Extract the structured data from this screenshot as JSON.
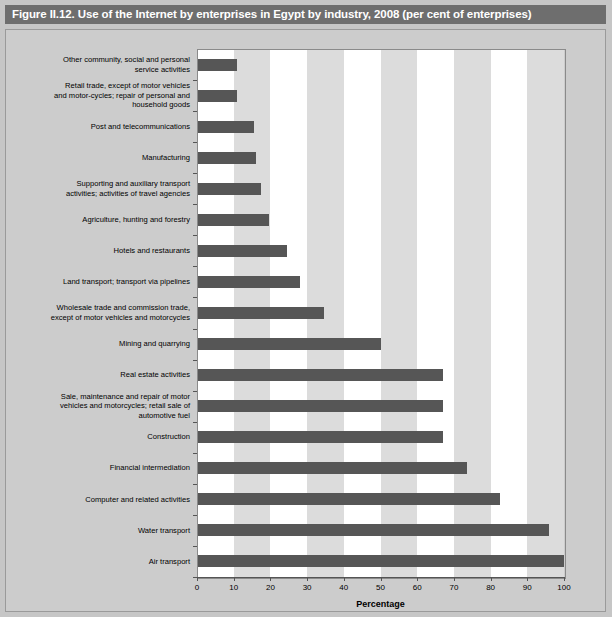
{
  "figure": {
    "title": "Figure II.12. Use of the Internet by enterprises in Egypt by industry, 2008 (per cent of enterprises)"
  },
  "colors": {
    "title_bar_bg": "#6e6e6e",
    "title_text": "#ffffff",
    "panel_bg": "#cccccc",
    "plot_bg": "#ffffff",
    "band": "#dcdcdc",
    "bar": "#565656",
    "axis": "#555555",
    "page_bg": "#c6c6c6"
  },
  "chart_data": {
    "type": "bar",
    "orientation": "horizontal",
    "title": "Figure II.12. Use of the Internet by enterprises in Egypt by industry, 2008 (per cent of enterprises)",
    "xlabel": "Percentage",
    "ylabel": "",
    "xlim": [
      0,
      100
    ],
    "xticks": [
      0,
      10,
      20,
      30,
      40,
      50,
      60,
      70,
      80,
      90,
      100
    ],
    "xtick_labels": [
      "0",
      "10",
      "20",
      "30",
      "40",
      "50",
      "60",
      "70",
      "80",
      "90",
      "100"
    ],
    "grid": false,
    "alternating_bands": true,
    "band_width": 10,
    "legend": null,
    "categories": [
      "Other community, social and personal\nservice activities",
      "Retail trade, except of motor vehicles\nand motor-cycles; repair of personal and\nhousehold goods",
      "Post and telecommunications",
      "Manufacturing",
      "Supporting and auxiliary transport\nactivities; activities of travel agencies",
      "Agriculture, hunting and forestry",
      "Hotels and restaurants",
      "Land transport; transport via pipelines",
      "Wholesale trade and commission trade,\nexcept of motor vehicles and motorcycles",
      "Mining and quarrying",
      "Real estate activities",
      "Sale, maintenance and repair of motor\nvehicles and motorcycles; retail sale of\nautomotive fuel",
      "Construction",
      "Financial intermediation",
      "Computer and related activities",
      "Water transport",
      "Air transport"
    ],
    "values": [
      11,
      11,
      15.5,
      16,
      17.5,
      19.5,
      24.5,
      28,
      34.5,
      50,
      67,
      67,
      67,
      73.5,
      82.5,
      96,
      100
    ]
  }
}
